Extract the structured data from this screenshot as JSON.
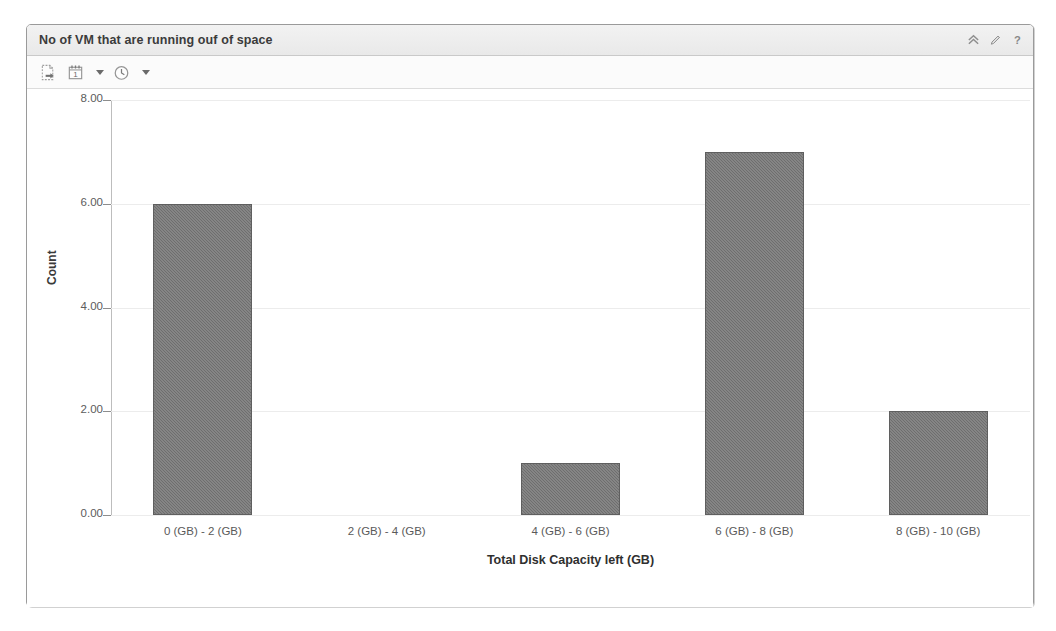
{
  "panel": {
    "title": "No of VM that are running ouf of space",
    "header_icons": [
      {
        "name": "collapse-icon",
        "glyph": "chevron-double-up"
      },
      {
        "name": "edit-icon",
        "glyph": "pencil"
      },
      {
        "name": "help-icon",
        "glyph": "question-mark"
      }
    ]
  },
  "toolbar": {
    "items": [
      {
        "name": "export-icon",
        "label": "Export",
        "has_caret": false
      },
      {
        "name": "calendar-icon",
        "label": "1",
        "has_caret": true
      },
      {
        "name": "clock-icon",
        "label": "Time Range",
        "has_caret": true
      }
    ],
    "calendar_day": "1"
  },
  "colors": {
    "bar_fill": "#6e6e6e",
    "bar_stroke": "#5f5f5f",
    "gridline": "#ececec",
    "axis": "#bdbdbd",
    "panel_border": "#9a9a9a",
    "header_bg": "#efefef",
    "text": "#3b3b3b"
  },
  "chart_data": {
    "type": "bar",
    "title": "No of VM that are running ouf of space",
    "categories": [
      "0 (GB) - 2 (GB)",
      "2 (GB) - 4 (GB)",
      "4 (GB) - 6 (GB)",
      "6 (GB) - 8 (GB)",
      "8 (GB) - 10 (GB)"
    ],
    "values": [
      6,
      0,
      1,
      7,
      2
    ],
    "xlabel": "Total Disk Capacity left (GB)",
    "ylabel": "Count",
    "ylim": [
      0,
      8
    ],
    "yticks": [
      0,
      2,
      4,
      6,
      8
    ],
    "ytick_labels": [
      "0.00",
      "2.00",
      "4.00",
      "6.00",
      "8.00"
    ],
    "grid": true,
    "legend": false
  }
}
